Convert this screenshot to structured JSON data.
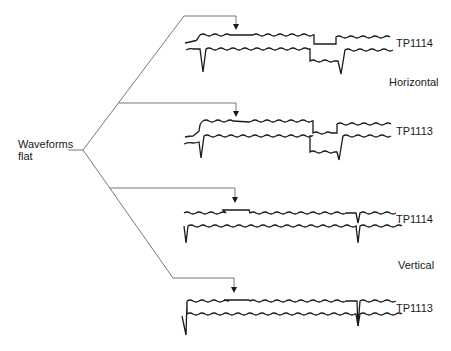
{
  "source": {
    "line1": "Waveforms",
    "line2": "flat"
  },
  "panels": [
    {
      "id": "h-tp1114",
      "testpoint": "TP1114",
      "group": "Horizontal"
    },
    {
      "id": "h-tp1113",
      "testpoint": "TP1113",
      "group": "Horizontal"
    },
    {
      "id": "v-tp1114",
      "testpoint": "TP1114",
      "group": "Vertical"
    },
    {
      "id": "v-tp1113",
      "testpoint": "TP1113",
      "group": "Vertical"
    }
  ],
  "groups": {
    "horizontal": "Horizontal",
    "vertical": "Vertical"
  },
  "colors": {
    "trace": "#1a1a1a",
    "connector": "#555555",
    "background": "#ffffff"
  }
}
